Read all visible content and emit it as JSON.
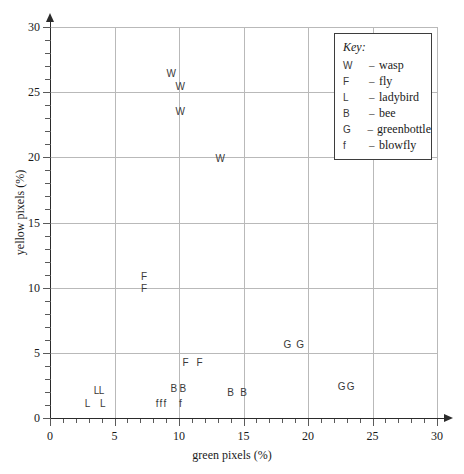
{
  "chart_data": {
    "type": "scatter",
    "title": "",
    "xlabel": "green pixels (%)",
    "ylabel": "yellow pixels (%)",
    "xlim": [
      0,
      30
    ],
    "ylim": [
      0,
      30
    ],
    "xticks": [
      0,
      5,
      10,
      15,
      20,
      25,
      30
    ],
    "yticks": [
      0,
      5,
      10,
      15,
      20,
      25,
      30
    ],
    "xtick_labels": [
      "0",
      "5",
      "10",
      "15",
      "20",
      "25",
      "30"
    ],
    "ytick_labels": [
      "0",
      "5",
      "10",
      "15",
      "20",
      "25",
      "30"
    ],
    "minor_tick_step": 1,
    "grid": true,
    "grid_color": "#b9b9b9",
    "axis_color": "#2b2b2b",
    "marker_style": "text-letter",
    "legend_position": "top-right",
    "legend_title": "Key:",
    "series": [
      {
        "name": "wasp",
        "symbol": "W",
        "points": [
          {
            "x": 9.4,
            "y": 26.4
          },
          {
            "x": 10.1,
            "y": 25.4
          },
          {
            "x": 10.1,
            "y": 23.5
          },
          {
            "x": 13.2,
            "y": 19.9
          }
        ]
      },
      {
        "name": "fly",
        "symbol": "F",
        "points": [
          {
            "x": 7.3,
            "y": 10.8
          },
          {
            "x": 7.3,
            "y": 9.9
          },
          {
            "x": 10.5,
            "y": 4.2
          },
          {
            "x": 11.6,
            "y": 4.2
          }
        ]
      },
      {
        "name": "ladybird",
        "symbol": "L",
        "points": [
          {
            "x": 2.9,
            "y": 1.1
          },
          {
            "x": 3.6,
            "y": 2.1
          },
          {
            "x": 4.0,
            "y": 2.1
          },
          {
            "x": 4.1,
            "y": 1.1
          }
        ]
      },
      {
        "name": "bee",
        "symbol": "B",
        "points": [
          {
            "x": 9.6,
            "y": 2.2
          },
          {
            "x": 10.3,
            "y": 2.2
          },
          {
            "x": 14.0,
            "y": 1.9
          },
          {
            "x": 15.0,
            "y": 1.9
          }
        ]
      },
      {
        "name": "greenbottle",
        "symbol": "G",
        "points": [
          {
            "x": 18.4,
            "y": 5.6
          },
          {
            "x": 19.4,
            "y": 5.6
          },
          {
            "x": 22.6,
            "y": 2.4
          },
          {
            "x": 23.3,
            "y": 2.4
          }
        ]
      },
      {
        "name": "blowfly",
        "symbol": "f",
        "points": [
          {
            "x": 8.3,
            "y": 1.1
          },
          {
            "x": 8.6,
            "y": 1.1
          },
          {
            "x": 8.9,
            "y": 1.1
          },
          {
            "x": 10.1,
            "y": 1.1
          }
        ]
      }
    ]
  },
  "legend": {
    "title": "Key:",
    "entries": [
      {
        "symbol": "W",
        "dash": "–",
        "label": "wasp"
      },
      {
        "symbol": "F",
        "dash": "–",
        "label": "fly"
      },
      {
        "symbol": "L",
        "dash": "–",
        "label": "ladybird"
      },
      {
        "symbol": "B",
        "dash": "–",
        "label": "bee"
      },
      {
        "symbol": "G",
        "dash": "–",
        "label": "greenbottle"
      },
      {
        "symbol": "f",
        "dash": "–",
        "label": "blowfly"
      }
    ]
  }
}
